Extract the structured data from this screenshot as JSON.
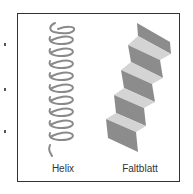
{
  "figure": {
    "panels": [
      {
        "id": "helix",
        "label": "Helix"
      },
      {
        "id": "sheet",
        "label": "Faltblatt"
      }
    ],
    "colors": {
      "frame": "#333333",
      "helix_stroke": "#8a8a8a",
      "sheet_dark": "#8c8c8c",
      "sheet_light": "#d4d4d4",
      "label": "#333333"
    }
  }
}
